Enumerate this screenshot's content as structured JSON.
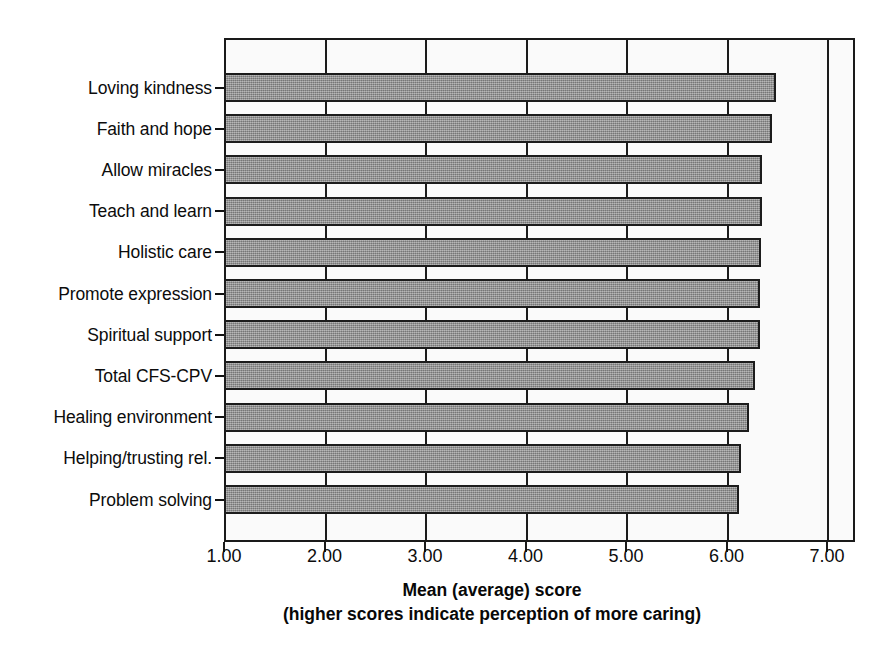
{
  "chart_data": {
    "type": "bar",
    "orientation": "horizontal",
    "title": "",
    "xlabel": "Mean (average) score",
    "xlabel_line2": "(higher scores indicate perception of more caring)",
    "ylabel": "",
    "xlim": [
      1.0,
      7.0
    ],
    "xticks": [
      1.0,
      2.0,
      3.0,
      4.0,
      5.0,
      6.0,
      7.0
    ],
    "xtick_labels": [
      "1.00",
      "2.00",
      "3.00",
      "4.00",
      "5.00",
      "6.00",
      "7.00"
    ],
    "grid": true,
    "legend": false,
    "bar_color": "#8f8f8f",
    "bar_edge_color": "#1c1c1c",
    "plot_background": "#fafafa",
    "categories": [
      "Loving kindness",
      "Faith and hope",
      "Allow miracles",
      "Teach and learn",
      "Holistic care",
      "Promote expression",
      "Spiritual support",
      "Total CFS-CPV",
      "Healing environment",
      "Helping/trusting rel.",
      "Problem solving"
    ],
    "values": [
      6.49,
      6.45,
      6.35,
      6.35,
      6.34,
      6.33,
      6.33,
      6.28,
      6.22,
      6.14,
      6.12
    ]
  },
  "axis_title": {
    "line1": "Mean (average) score",
    "line2": "(higher scores indicate perception of more caring)"
  }
}
